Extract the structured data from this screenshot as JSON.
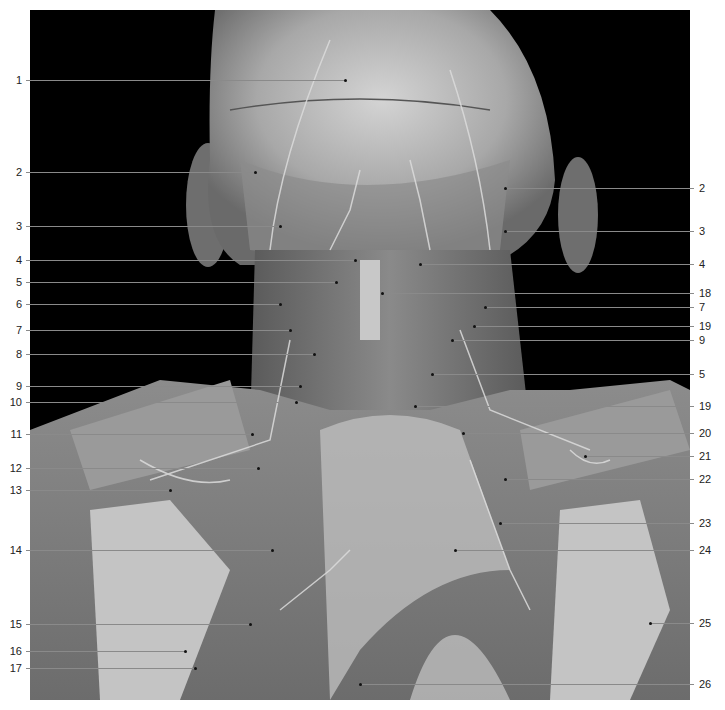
{
  "figure": {
    "labels_left": [
      {
        "n": "1",
        "y": 80,
        "end_x": 345
      },
      {
        "n": "2",
        "y": 172,
        "end_x": 255
      },
      {
        "n": "3",
        "y": 226,
        "end_x": 280
      },
      {
        "n": "4",
        "y": 260,
        "end_x": 355
      },
      {
        "n": "5",
        "y": 282,
        "end_x": 336
      },
      {
        "n": "6",
        "y": 304,
        "end_x": 280
      },
      {
        "n": "7",
        "y": 330,
        "end_x": 290
      },
      {
        "n": "8",
        "y": 354,
        "end_x": 314
      },
      {
        "n": "9",
        "y": 386,
        "end_x": 300
      },
      {
        "n": "10",
        "y": 402,
        "end_x": 296
      },
      {
        "n": "11",
        "y": 434,
        "end_x": 252
      },
      {
        "n": "12",
        "y": 468,
        "end_x": 258
      },
      {
        "n": "13",
        "y": 490,
        "end_x": 170
      },
      {
        "n": "14",
        "y": 550,
        "end_x": 272
      },
      {
        "n": "15",
        "y": 624,
        "end_x": 250
      },
      {
        "n": "16",
        "y": 651,
        "end_x": 185
      },
      {
        "n": "17",
        "y": 668,
        "end_x": 195
      }
    ],
    "labels_right": [
      {
        "n": "2",
        "y": 188,
        "end_x": 505
      },
      {
        "n": "3",
        "y": 231,
        "end_x": 505
      },
      {
        "n": "4",
        "y": 264,
        "end_x": 420
      },
      {
        "n": "18",
        "y": 293,
        "end_x": 382
      },
      {
        "n": "7",
        "y": 307,
        "end_x": 485
      },
      {
        "n": "19",
        "y": 326,
        "end_x": 474
      },
      {
        "n": "9",
        "y": 340,
        "end_x": 452
      },
      {
        "n": "5",
        "y": 374,
        "end_x": 432
      },
      {
        "n": "19",
        "y": 406,
        "end_x": 415
      },
      {
        "n": "20",
        "y": 433,
        "end_x": 463
      },
      {
        "n": "21",
        "y": 456,
        "end_x": 585
      },
      {
        "n": "22",
        "y": 479,
        "end_x": 505
      },
      {
        "n": "23",
        "y": 523,
        "end_x": 500
      },
      {
        "n": "24",
        "y": 550,
        "end_x": 455
      },
      {
        "n": "25",
        "y": 623,
        "end_x": 650
      },
      {
        "n": "26",
        "y": 684,
        "end_x": 360
      }
    ],
    "colors": {
      "background": "#000000",
      "page": "#ffffff",
      "leader": "#8a8a8a",
      "label_text": "#222222"
    }
  }
}
